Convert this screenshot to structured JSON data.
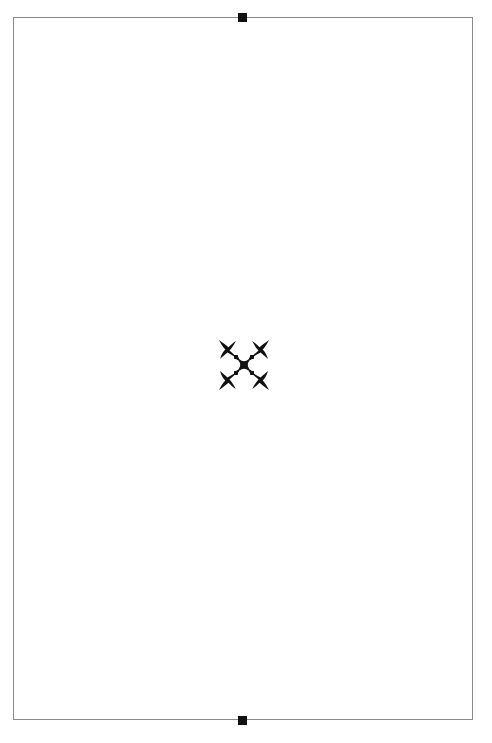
{
  "page": {
    "background": "#ffffff",
    "frame_color": "#8a8a8a",
    "marker_color": "#111111",
    "ornament_color": "#111111"
  },
  "markers": {
    "top": "marker-top",
    "bottom": "marker-bottom"
  },
  "ornament": {
    "icon": "fleuron-ornament-icon"
  }
}
